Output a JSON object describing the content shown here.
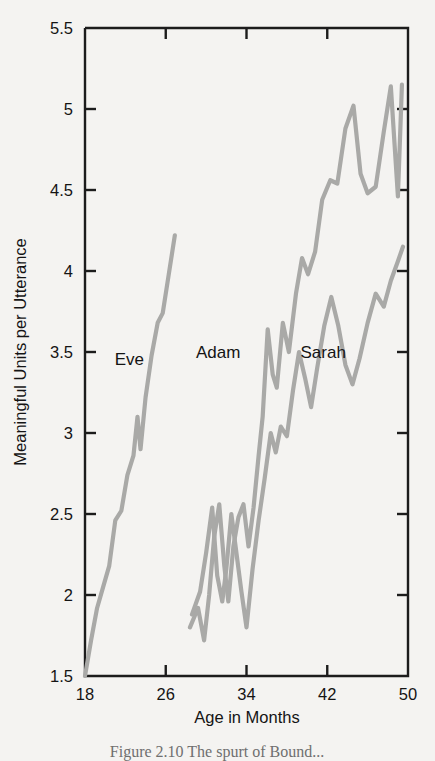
{
  "chart_data": {
    "type": "line",
    "title": "",
    "xlabel": "Age in Months",
    "ylabel": "Meaningful Units per Utterance",
    "xlim": [
      18,
      50
    ],
    "ylim": [
      1.5,
      5.5
    ],
    "xticks": [
      18,
      26,
      34,
      42,
      50
    ],
    "yticks": [
      1.5,
      2,
      2.5,
      3,
      3.5,
      4,
      4.5,
      5,
      5.5
    ],
    "xtick_labels": [
      "18",
      "26",
      "34",
      "42",
      "50"
    ],
    "ytick_labels": [
      "1.5",
      "2",
      "2.5",
      "3",
      "3.5",
      "4",
      "4.5",
      "5",
      "5.5"
    ],
    "grid": false,
    "legend": "inline annotations",
    "annotations": [
      {
        "text": "Eve",
        "x": 22.4,
        "y": 3.42
      },
      {
        "text": "Adam",
        "x": 31.2,
        "y": 3.46
      },
      {
        "text": "Sarah",
        "x": 41.6,
        "y": 3.46
      }
    ],
    "series": [
      {
        "name": "Eve",
        "points": [
          [
            18.0,
            1.5
          ],
          [
            18.6,
            1.72
          ],
          [
            19.2,
            1.92
          ],
          [
            19.8,
            2.05
          ],
          [
            20.4,
            2.18
          ],
          [
            21.0,
            2.46
          ],
          [
            21.6,
            2.52
          ],
          [
            22.2,
            2.74
          ],
          [
            22.8,
            2.86
          ],
          [
            23.2,
            3.1
          ],
          [
            23.5,
            2.9
          ],
          [
            24.0,
            3.22
          ],
          [
            24.6,
            3.48
          ],
          [
            25.2,
            3.68
          ],
          [
            25.7,
            3.74
          ],
          [
            26.3,
            3.98
          ],
          [
            26.9,
            4.22
          ]
        ]
      },
      {
        "name": "Adam",
        "points": [
          [
            28.4,
            1.8
          ],
          [
            29.2,
            1.92
          ],
          [
            29.8,
            1.72
          ],
          [
            30.3,
            2.0
          ],
          [
            30.8,
            2.36
          ],
          [
            31.3,
            2.56
          ],
          [
            31.8,
            2.18
          ],
          [
            32.2,
            1.96
          ],
          [
            32.7,
            2.3
          ],
          [
            33.2,
            2.48
          ],
          [
            33.7,
            2.56
          ],
          [
            34.2,
            2.3
          ],
          [
            34.7,
            2.54
          ],
          [
            35.2,
            2.86
          ],
          [
            35.6,
            3.1
          ],
          [
            36.1,
            3.64
          ],
          [
            36.6,
            3.36
          ],
          [
            37.0,
            3.28
          ],
          [
            37.6,
            3.68
          ],
          [
            38.2,
            3.5
          ],
          [
            38.9,
            3.86
          ],
          [
            39.5,
            4.08
          ],
          [
            40.1,
            3.98
          ],
          [
            40.8,
            4.12
          ],
          [
            41.5,
            4.44
          ],
          [
            42.3,
            4.56
          ],
          [
            43.0,
            4.54
          ],
          [
            43.8,
            4.88
          ],
          [
            44.6,
            5.02
          ],
          [
            45.3,
            4.6
          ],
          [
            46.0,
            4.48
          ],
          [
            46.8,
            4.52
          ],
          [
            47.6,
            4.86
          ],
          [
            48.3,
            5.14
          ],
          [
            49.0,
            4.46
          ],
          [
            49.4,
            5.15
          ]
        ]
      },
      {
        "name": "Sarah",
        "points": [
          [
            28.6,
            1.88
          ],
          [
            29.4,
            2.02
          ],
          [
            30.0,
            2.26
          ],
          [
            30.6,
            2.54
          ],
          [
            31.1,
            2.12
          ],
          [
            31.6,
            1.96
          ],
          [
            32.0,
            2.16
          ],
          [
            32.5,
            2.5
          ],
          [
            33.0,
            2.26
          ],
          [
            33.5,
            2.02
          ],
          [
            34.0,
            1.8
          ],
          [
            34.6,
            2.16
          ],
          [
            35.2,
            2.46
          ],
          [
            35.8,
            2.72
          ],
          [
            36.4,
            3.0
          ],
          [
            36.9,
            2.88
          ],
          [
            37.4,
            3.04
          ],
          [
            38.0,
            2.98
          ],
          [
            38.6,
            3.26
          ],
          [
            39.2,
            3.5
          ],
          [
            39.8,
            3.34
          ],
          [
            40.4,
            3.16
          ],
          [
            41.0,
            3.4
          ],
          [
            41.7,
            3.66
          ],
          [
            42.4,
            3.84
          ],
          [
            43.1,
            3.66
          ],
          [
            43.8,
            3.42
          ],
          [
            44.5,
            3.3
          ],
          [
            45.2,
            3.46
          ],
          [
            46.0,
            3.68
          ],
          [
            46.8,
            3.86
          ],
          [
            47.6,
            3.78
          ],
          [
            48.3,
            3.94
          ],
          [
            49.0,
            4.06
          ],
          [
            49.5,
            4.15
          ]
        ]
      }
    ]
  },
  "caption": {
    "text": "Figure 2.10   The spurt of Bound..."
  }
}
